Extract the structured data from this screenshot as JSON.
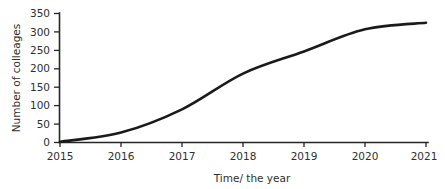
{
  "chart_data": {
    "type": "line",
    "title": "",
    "xlabel": "Time/ the year",
    "ylabel": "Number of  colleages",
    "categories": [
      "2015",
      "2016",
      "2017",
      "2018",
      "2019",
      "2020",
      "2021"
    ],
    "x": [
      2015,
      2016,
      2017,
      2018,
      2019,
      2020,
      2021
    ],
    "values": [
      2,
      27,
      90,
      187,
      247,
      307,
      325
    ],
    "series": [
      {
        "name": "Number of colleages",
        "values": [
          2,
          27,
          90,
          187,
          247,
          307,
          325
        ]
      }
    ],
    "xlim": [
      2015,
      2021
    ],
    "ylim": [
      0,
      350
    ],
    "yticks": [
      "0",
      "50",
      "100",
      "150",
      "200",
      "250",
      "300",
      "350"
    ],
    "ytick_values": [
      0,
      50,
      100,
      150,
      200,
      250,
      300,
      350
    ],
    "xticks": [
      "2015",
      "2016",
      "2017",
      "2018",
      "2019",
      "2020",
      "2021"
    ],
    "grid": false,
    "legend": false,
    "legend_position": "none",
    "line_color": "#1a1a1a",
    "axis_color": "#262626",
    "background_color": "#ffffff"
  }
}
